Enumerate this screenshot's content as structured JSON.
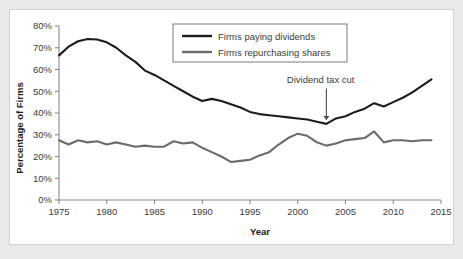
{
  "chart_data": {
    "type": "line",
    "title": "",
    "xlabel": "Year",
    "ylabel": "Percentage of Firms",
    "xlim": [
      1975,
      2015
    ],
    "ylim": [
      0,
      80
    ],
    "xticks": [
      "1975",
      "1980",
      "1985",
      "1990",
      "1995",
      "2000",
      "2005",
      "2010",
      "2015"
    ],
    "yticks": [
      "0%",
      "10%",
      "20%",
      "30%",
      "40%",
      "50%",
      "60%",
      "70%",
      "80%"
    ],
    "grid": false,
    "legend_position": "top-center",
    "x": [
      1975,
      1976,
      1977,
      1978,
      1979,
      1980,
      1981,
      1982,
      1983,
      1984,
      1985,
      1986,
      1987,
      1988,
      1989,
      1990,
      1991,
      1992,
      1993,
      1994,
      1995,
      1996,
      1997,
      1998,
      1999,
      2000,
      2001,
      2002,
      2003,
      2004,
      2005,
      2006,
      2007,
      2008,
      2009,
      2010,
      2011,
      2012,
      2013,
      2014
    ],
    "series": [
      {
        "name": "Firms paying dividends",
        "color": "#1c1c1c",
        "width": 2.1,
        "values": [
          66.5,
          70.5,
          73.0,
          74.0,
          73.8,
          72.5,
          70.0,
          66.5,
          63.5,
          59.5,
          57.5,
          55.0,
          52.5,
          50.0,
          47.5,
          45.5,
          46.5,
          45.5,
          44.0,
          42.5,
          40.5,
          39.5,
          39.0,
          38.5,
          38.0,
          37.5,
          37.0,
          36.0,
          35.0,
          37.5,
          38.5,
          40.5,
          42.0,
          44.5,
          43.0,
          45.0,
          47.0,
          49.5,
          52.5,
          55.5
        ]
      },
      {
        "name": "Firms repurchasing shares",
        "color": "#6b6b6b",
        "width": 2.1,
        "values": [
          27.5,
          25.5,
          27.5,
          26.5,
          27.0,
          25.5,
          26.5,
          25.5,
          24.5,
          25.0,
          24.5,
          24.5,
          27.0,
          26.0,
          26.5,
          24.0,
          22.0,
          20.0,
          17.5,
          18.0,
          18.5,
          20.5,
          22.0,
          25.5,
          28.5,
          30.5,
          29.5,
          26.5,
          25.0,
          26.0,
          27.5,
          28.0,
          28.5,
          31.5,
          26.5,
          27.5,
          27.5,
          27.0,
          27.5,
          27.5
        ]
      }
    ],
    "annotations": [
      {
        "text": "Dividend tax cut",
        "target_x": 2003,
        "target_y": 35.0,
        "label_x": 2002.4,
        "label_y": 54.0,
        "arrow": "down-arrow"
      }
    ]
  }
}
